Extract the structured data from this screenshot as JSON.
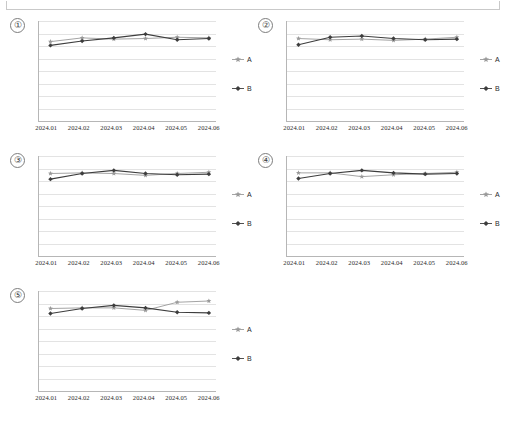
{
  "document": {
    "frame_visible": true
  },
  "series_colors": {
    "A": "#9a9a9a",
    "B": "#3d3d3d",
    "gridline": "#e3e3e3",
    "axis": "#b6b6b6"
  },
  "legend": {
    "a_label": "A",
    "b_label": "B",
    "a_marker": "star-marker-icon",
    "b_marker": "diamond-marker-icon"
  },
  "charts": [
    {
      "index_label": "①",
      "chart_data": {
        "type": "line",
        "title": "",
        "xlabel": "",
        "ylabel": "",
        "grid": true,
        "legend_position": "right",
        "ylim": [
          0,
          8
        ],
        "categories": [
          "2024.01",
          "2024.02",
          "2024.03",
          "2024.04",
          "2024.05",
          "2024.06"
        ],
        "series": [
          {
            "name": "A",
            "values": [
              6.35,
              6.65,
              6.55,
              6.6,
              6.7,
              6.65
            ]
          },
          {
            "name": "B",
            "values": [
              6.05,
              6.4,
              6.65,
              6.95,
              6.5,
              6.6
            ]
          }
        ]
      }
    },
    {
      "index_label": "②",
      "chart_data": {
        "type": "line",
        "title": "",
        "xlabel": "",
        "ylabel": "",
        "grid": true,
        "legend_position": "right",
        "ylim": [
          0,
          8
        ],
        "categories": [
          "2024.01",
          "2024.02",
          "2024.03",
          "2024.04",
          "2024.05",
          "2024.06"
        ],
        "series": [
          {
            "name": "A",
            "values": [
              6.6,
              6.5,
              6.55,
              6.45,
              6.55,
              6.7
            ]
          },
          {
            "name": "B",
            "values": [
              6.1,
              6.7,
              6.8,
              6.6,
              6.5,
              6.55
            ]
          }
        ]
      }
    },
    {
      "index_label": "③",
      "chart_data": {
        "type": "line",
        "title": "",
        "xlabel": "",
        "ylabel": "",
        "grid": true,
        "legend_position": "right",
        "ylim": [
          0,
          8
        ],
        "categories": [
          "2024.01",
          "2024.02",
          "2024.03",
          "2024.04",
          "2024.05",
          "2024.06"
        ],
        "series": [
          {
            "name": "A",
            "values": [
              6.6,
              6.65,
              6.6,
              6.45,
              6.6,
              6.7
            ]
          },
          {
            "name": "B",
            "values": [
              6.15,
              6.6,
              6.85,
              6.6,
              6.5,
              6.55
            ]
          }
        ]
      }
    },
    {
      "index_label": "④",
      "chart_data": {
        "type": "line",
        "title": "",
        "xlabel": "",
        "ylabel": "",
        "grid": true,
        "legend_position": "right",
        "ylim": [
          0,
          8
        ],
        "categories": [
          "2024.01",
          "2024.02",
          "2024.03",
          "2024.04",
          "2024.05",
          "2024.06"
        ],
        "series": [
          {
            "name": "A",
            "values": [
              6.65,
              6.65,
              6.35,
              6.5,
              6.6,
              6.7
            ]
          },
          {
            "name": "B",
            "values": [
              6.2,
              6.6,
              6.85,
              6.65,
              6.55,
              6.6
            ]
          }
        ]
      }
    },
    {
      "index_label": "⑤",
      "chart_data": {
        "type": "line",
        "title": "",
        "xlabel": "",
        "ylabel": "",
        "grid": true,
        "legend_position": "right",
        "ylim": [
          0,
          8
        ],
        "categories": [
          "2024.01",
          "2024.02",
          "2024.03",
          "2024.04",
          "2024.05",
          "2024.06"
        ],
        "series": [
          {
            "name": "A",
            "values": [
              6.6,
              6.65,
              6.65,
              6.45,
              7.1,
              7.2
            ]
          },
          {
            "name": "B",
            "values": [
              6.2,
              6.6,
              6.85,
              6.65,
              6.3,
              6.25
            ]
          }
        ]
      }
    }
  ]
}
